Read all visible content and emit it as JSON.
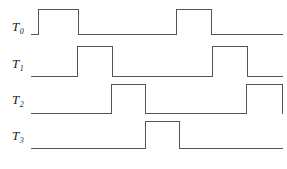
{
  "figure": {
    "width": 287,
    "height": 169,
    "background": "#ffffff",
    "line_color": "#555555",
    "label_color": "#1a1a1a"
  },
  "labels": [
    {
      "base": "T",
      "sub": "0",
      "x": 12,
      "y": 20
    },
    {
      "base": "T",
      "sub": "1",
      "x": 12,
      "y": 57
    },
    {
      "base": "T",
      "sub": "2",
      "x": 12,
      "y": 93
    },
    {
      "base": "T",
      "sub": "3",
      "x": 12,
      "y": 129
    }
  ],
  "chart_data": {
    "type": "line",
    "title": "",
    "xlabel": "",
    "ylabel": "",
    "grid": false,
    "legend": "none",
    "x_start": 31,
    "x_end": 282,
    "signals": [
      {
        "name": "T0",
        "low_y": 34,
        "high_y": 9,
        "points": "31,34 38,34 38,9 78,9 78,34 176,34 176,9 211,9 211,34 282,34",
        "pulses": [
          {
            "rise": 38,
            "fall": 78
          },
          {
            "rise": 176,
            "fall": 211
          }
        ]
      },
      {
        "name": "T1",
        "low_y": 76,
        "high_y": 46,
        "points": "31,76 77,76 77,46 112,46 112,76 212,76 212,46 247,46 247,76 282,76",
        "pulses": [
          {
            "rise": 77,
            "fall": 112
          },
          {
            "rise": 212,
            "fall": 247
          }
        ]
      },
      {
        "name": "T2",
        "low_y": 113,
        "high_y": 84,
        "points": "31,113 111,113 111,84 145,84 145,113 246,113 246,84 282,84 282,113",
        "pulses": [
          {
            "rise": 111,
            "fall": 145
          },
          {
            "rise": 246,
            "fall": 282
          }
        ]
      },
      {
        "name": "T3",
        "low_y": 148,
        "high_y": 121,
        "points": "31,148 145,148 145,121 179,121 179,148 282,148",
        "pulses": [
          {
            "rise": 145,
            "fall": 179
          }
        ]
      }
    ]
  }
}
